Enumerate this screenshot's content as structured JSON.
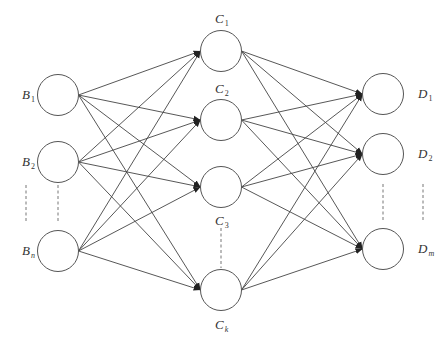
{
  "diagram": {
    "type": "fully-connected neural network",
    "colors": {
      "stroke": "#555555",
      "background": "#ffffff",
      "text": "#333333"
    },
    "node_radius": 20.5,
    "layers": [
      {
        "name": "input",
        "x": 58,
        "nodes": [
          {
            "id": "B1",
            "letter": "B",
            "sub": "1",
            "y": 95,
            "label_x": 22,
            "label_y": 88
          },
          {
            "id": "B2",
            "letter": "B",
            "sub": "2",
            "y": 162,
            "label_x": 22,
            "label_y": 155
          },
          {
            "id": "Bn",
            "letter": "B",
            "sub": "n",
            "y": 251,
            "label_x": 22,
            "label_y": 244
          }
        ],
        "ellipsis_lines": [
          {
            "x": 26,
            "y1": 185,
            "y2": 223
          },
          {
            "x": 58,
            "y1": 185,
            "y2": 223
          }
        ]
      },
      {
        "name": "hidden",
        "x": 221,
        "nodes": [
          {
            "id": "C1",
            "letter": "C",
            "sub": "1",
            "y": 51,
            "label_x": 215,
            "label_y": 12
          },
          {
            "id": "C2",
            "letter": "C",
            "sub": "2",
            "y": 120,
            "label_x": 215,
            "label_y": 82
          },
          {
            "id": "C3",
            "letter": "C",
            "sub": "3",
            "y": 187,
            "label_x": 215,
            "label_y": 214
          },
          {
            "id": "Ck",
            "letter": "C",
            "sub": "k",
            "y": 290,
            "label_x": 215,
            "label_y": 318
          }
        ],
        "ellipsis_lines": [
          {
            "x": 221,
            "y1": 228,
            "y2": 268
          }
        ]
      },
      {
        "name": "output",
        "x": 383,
        "nodes": [
          {
            "id": "D1",
            "letter": "D",
            "sub": "1",
            "y": 94,
            "label_x": 418,
            "label_y": 87
          },
          {
            "id": "D2",
            "letter": "D",
            "sub": "2",
            "y": 154,
            "label_x": 418,
            "label_y": 147
          },
          {
            "id": "Dm",
            "letter": "D",
            "sub": "m",
            "y": 249,
            "label_x": 418,
            "label_y": 242
          }
        ],
        "ellipsis_lines": [
          {
            "x": 383,
            "y1": 184,
            "y2": 222
          },
          {
            "x": 423,
            "y1": 184,
            "y2": 222
          }
        ]
      }
    ]
  }
}
